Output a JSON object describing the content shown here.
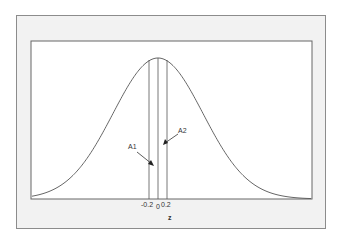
{
  "chart_data": {
    "type": "line",
    "title": "",
    "xlabel": "z",
    "ylabel": "",
    "series": [
      {
        "name": "standard normal density",
        "function": "exp(-z^2/2)/sqrt(2*pi)"
      }
    ],
    "x_ticks": [
      "-0.2",
      "0",
      "0.2"
    ],
    "vertical_lines": [
      -0.2,
      0,
      0.2
    ],
    "annotations": [
      {
        "text": "A1",
        "points_to": "area between -0.2 and 0"
      },
      {
        "text": "A2",
        "points_to": "area between 0 and 0.2"
      }
    ],
    "xlim": [
      -3.5,
      3.5
    ],
    "grid": false,
    "legend": "none"
  },
  "labels": {
    "tick_neg": "-0.2",
    "tick_zero": "0",
    "tick_pos": "0.2",
    "xlabel": "z",
    "a1": "A1",
    "a2": "A2"
  },
  "colors": {
    "curve": "#555555",
    "frame": "#8c8c8c",
    "panel": "#f2f2f2"
  }
}
